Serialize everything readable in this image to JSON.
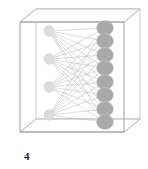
{
  "figure": {
    "caption_label": "4",
    "title": "",
    "container": {
      "shape_name": "3d-box",
      "stroke_color": "#b9b9b9",
      "fill_color": "#ffffff",
      "front_face": {
        "x": 20,
        "y": 22,
        "width": 104,
        "height": 110
      },
      "depth_x": 16,
      "depth_y": 13
    },
    "edge_color": "#bdbdbd",
    "left_node_color": "#dcdcdc",
    "right_node_color": "#a9a9a9",
    "node_stroke_color": "#cfcfcf"
  },
  "chart_data": {
    "type": "diagram",
    "subtype": "bipartite-graph",
    "title": "",
    "xlabel": "",
    "ylabel": "",
    "annotations": [
      "4"
    ],
    "legend": [],
    "layers": [
      {
        "name": "left-layer",
        "count": 4,
        "node_radius_x": 5.0,
        "node_radius_y": 5.5,
        "color": "#dcdcdc",
        "nodes": [
          {
            "id": "L1",
            "x": 49,
            "y": 31
          },
          {
            "id": "L2",
            "x": 49,
            "y": 59
          },
          {
            "id": "L3",
            "x": 49,
            "y": 87
          },
          {
            "id": "L4",
            "x": 49,
            "y": 115
          }
        ]
      },
      {
        "name": "right-layer",
        "count": 8,
        "node_radius_x": 8.5,
        "node_radius_y": 7.5,
        "color": "#a9a9a9",
        "nodes": [
          {
            "id": "R1",
            "x": 105,
            "y": 28
          },
          {
            "id": "R2",
            "x": 105,
            "y": 41
          },
          {
            "id": "R3",
            "x": 105,
            "y": 55
          },
          {
            "id": "R4",
            "x": 105,
            "y": 68
          },
          {
            "id": "R5",
            "x": 105,
            "y": 82
          },
          {
            "id": "R6",
            "x": 105,
            "y": 95
          },
          {
            "id": "R7",
            "x": 105,
            "y": 109
          },
          {
            "id": "R8",
            "x": 105,
            "y": 122
          }
        ]
      }
    ],
    "edges_fully_connected": true,
    "edge_count": 32,
    "edges": [
      [
        "L1",
        "R1"
      ],
      [
        "L1",
        "R2"
      ],
      [
        "L1",
        "R3"
      ],
      [
        "L1",
        "R4"
      ],
      [
        "L1",
        "R5"
      ],
      [
        "L1",
        "R6"
      ],
      [
        "L1",
        "R7"
      ],
      [
        "L1",
        "R8"
      ],
      [
        "L2",
        "R1"
      ],
      [
        "L2",
        "R2"
      ],
      [
        "L2",
        "R3"
      ],
      [
        "L2",
        "R4"
      ],
      [
        "L2",
        "R5"
      ],
      [
        "L2",
        "R6"
      ],
      [
        "L2",
        "R7"
      ],
      [
        "L2",
        "R8"
      ],
      [
        "L3",
        "R1"
      ],
      [
        "L3",
        "R2"
      ],
      [
        "L3",
        "R3"
      ],
      [
        "L3",
        "R4"
      ],
      [
        "L3",
        "R5"
      ],
      [
        "L3",
        "R6"
      ],
      [
        "L3",
        "R7"
      ],
      [
        "L3",
        "R8"
      ],
      [
        "L4",
        "R1"
      ],
      [
        "L4",
        "R2"
      ],
      [
        "L4",
        "R3"
      ],
      [
        "L4",
        "R4"
      ],
      [
        "L4",
        "R5"
      ],
      [
        "L4",
        "R6"
      ],
      [
        "L4",
        "R7"
      ],
      [
        "L4",
        "R8"
      ]
    ]
  }
}
